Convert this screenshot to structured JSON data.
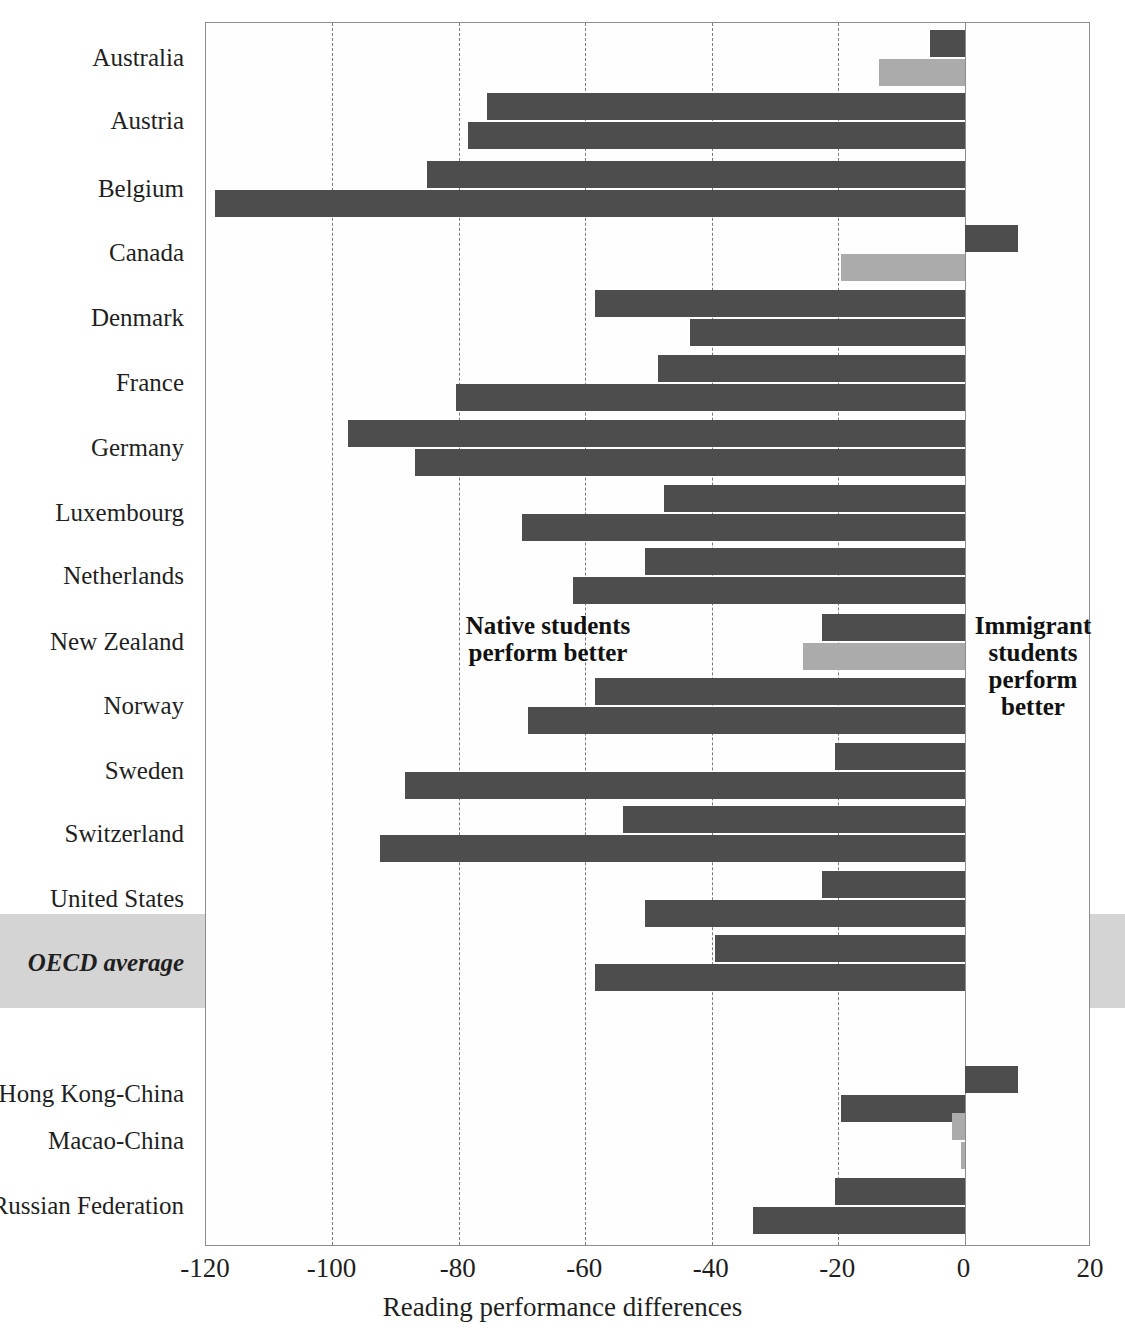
{
  "chart_data": {
    "type": "bar",
    "orientation": "horizontal",
    "title": "",
    "xlabel": "Reading performance differences",
    "ylabel": "",
    "xlim": [
      -120,
      20
    ],
    "xticks": [
      -120,
      -100,
      -80,
      -60,
      -40,
      -20,
      0,
      20
    ],
    "xtick_labels": [
      "-120",
      "-100",
      "-80",
      "-60",
      "-40",
      "-20",
      "0",
      "20"
    ],
    "grid": "vertical-dashed",
    "legend_position": "none",
    "zero_reference": 0,
    "annotations": [
      {
        "name": "native-better",
        "text": "Native students perform better",
        "lines": [
          "Native students",
          "perform better"
        ]
      },
      {
        "name": "immigrant-better",
        "text": "Immigrant students perform better",
        "lines": [
          "Immigrant",
          "students",
          "perform",
          "better"
        ]
      }
    ],
    "series": [
      {
        "name": "first-generation students",
        "color": "#4d4d4d"
      },
      {
        "name": "second-generation students",
        "color": "#ababab"
      }
    ],
    "categories": [
      "Australia",
      "Austria",
      "Belgium",
      "Canada",
      "Denmark",
      "France",
      "Germany",
      "Luxembourg",
      "Netherlands",
      "New Zealand",
      "Norway",
      "Sweden",
      "Switzerland",
      "United States",
      "OECD average",
      "Hong Kong-China",
      "Macao-China",
      "Russian Federation"
    ],
    "rows": [
      {
        "label": "Australia",
        "emphasis": false,
        "highlight": false,
        "bars": [
          {
            "value": -5.5,
            "shade": "dark"
          },
          {
            "value": -13.5,
            "shade": "light"
          }
        ]
      },
      {
        "label": "Austria",
        "emphasis": false,
        "highlight": false,
        "bars": [
          {
            "value": -75.5,
            "shade": "dark"
          },
          {
            "value": -78.5,
            "shade": "dark"
          }
        ]
      },
      {
        "label": "Belgium",
        "emphasis": false,
        "highlight": false,
        "bars": [
          {
            "value": -85.0,
            "shade": "dark"
          },
          {
            "value": -118.5,
            "shade": "dark"
          }
        ]
      },
      {
        "label": "Canada",
        "emphasis": false,
        "highlight": false,
        "bars": [
          {
            "value": 8.5,
            "shade": "dark"
          },
          {
            "value": -19.5,
            "shade": "light"
          }
        ]
      },
      {
        "label": "Denmark",
        "emphasis": false,
        "highlight": false,
        "bars": [
          {
            "value": -58.5,
            "shade": "dark"
          },
          {
            "value": -43.5,
            "shade": "dark"
          }
        ]
      },
      {
        "label": "France",
        "emphasis": false,
        "highlight": false,
        "bars": [
          {
            "value": -48.5,
            "shade": "dark"
          },
          {
            "value": -80.5,
            "shade": "dark"
          }
        ]
      },
      {
        "label": "Germany",
        "emphasis": false,
        "highlight": false,
        "bars": [
          {
            "value": -97.5,
            "shade": "dark"
          },
          {
            "value": -87.0,
            "shade": "dark"
          }
        ]
      },
      {
        "label": "Luxembourg",
        "emphasis": false,
        "highlight": false,
        "bars": [
          {
            "value": -47.5,
            "shade": "dark"
          },
          {
            "value": -70.0,
            "shade": "dark"
          }
        ]
      },
      {
        "label": "Netherlands",
        "emphasis": false,
        "highlight": false,
        "bars": [
          {
            "value": -50.5,
            "shade": "dark"
          },
          {
            "value": -62.0,
            "shade": "dark"
          }
        ]
      },
      {
        "label": "New Zealand",
        "emphasis": false,
        "highlight": false,
        "bars": [
          {
            "value": -22.5,
            "shade": "dark"
          },
          {
            "value": -25.5,
            "shade": "light"
          }
        ]
      },
      {
        "label": "Norway",
        "emphasis": false,
        "highlight": false,
        "bars": [
          {
            "value": -58.5,
            "shade": "dark"
          },
          {
            "value": -69.0,
            "shade": "dark"
          }
        ]
      },
      {
        "label": "Sweden",
        "emphasis": false,
        "highlight": false,
        "bars": [
          {
            "value": -20.5,
            "shade": "dark"
          },
          {
            "value": -88.5,
            "shade": "dark"
          }
        ]
      },
      {
        "label": "Switzerland",
        "emphasis": false,
        "highlight": false,
        "bars": [
          {
            "value": -54.0,
            "shade": "dark"
          },
          {
            "value": -92.5,
            "shade": "dark"
          }
        ]
      },
      {
        "label": "United States",
        "emphasis": false,
        "highlight": false,
        "bars": [
          {
            "value": -22.5,
            "shade": "dark"
          },
          {
            "value": -50.5,
            "shade": "dark"
          }
        ]
      },
      {
        "label": "OECD average",
        "emphasis": true,
        "highlight": true,
        "bars": [
          {
            "value": -39.5,
            "shade": "dark"
          },
          {
            "value": -58.5,
            "shade": "dark"
          }
        ]
      },
      {
        "label": "Hong Kong-China",
        "emphasis": false,
        "highlight": false,
        "bars": [
          {
            "value": 8.5,
            "shade": "dark"
          },
          {
            "value": -19.5,
            "shade": "dark"
          }
        ]
      },
      {
        "label": "Macao-China",
        "emphasis": false,
        "highlight": false,
        "bars": [
          {
            "value": -2.0,
            "shade": "light"
          },
          {
            "value": -0.5,
            "shade": "light"
          }
        ]
      },
      {
        "label": "Russian Federation",
        "emphasis": false,
        "highlight": false,
        "bars": [
          {
            "value": -20.5,
            "shade": "dark"
          },
          {
            "value": -33.5,
            "shade": "dark"
          }
        ]
      }
    ]
  },
  "colors": {
    "bar_dark": "#4d4d4d",
    "bar_light": "#ababab",
    "grid": "#7b7b7b",
    "axis": "#8d8d8d",
    "highlight_band": "#cdcdcd",
    "text": "#1f1f1f",
    "background": "#ffffff"
  }
}
